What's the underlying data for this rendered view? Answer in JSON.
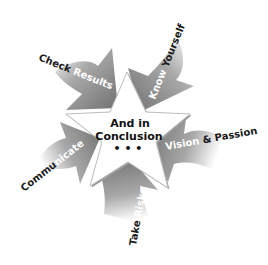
{
  "center": {
    "line1": "And in",
    "line2": "Conclusion",
    "line3": "• • •"
  },
  "arrows": [
    {
      "label_dark": "Check ",
      "label_light": "Results",
      "position": "upper-left"
    },
    {
      "label_light": "Know ",
      "label_dark": "Yourself",
      "position": "upper-right"
    },
    {
      "label_light": "Vision ",
      "label_dark": "& Passion",
      "position": "right"
    },
    {
      "label_dark": "Take ",
      "label_light": "Risks",
      "position": "bottom"
    },
    {
      "label_dark": "Commu",
      "label_light": "nicate",
      "position": "left"
    }
  ],
  "colors": {
    "arrow_dark": "#6e6e6e",
    "arrow_light": "#f4f4f4",
    "star_fill": "#ffffff",
    "star_edge": "#9a9a9a",
    "text_dark": "#1a1a1a",
    "text_light": "#ffffff"
  }
}
